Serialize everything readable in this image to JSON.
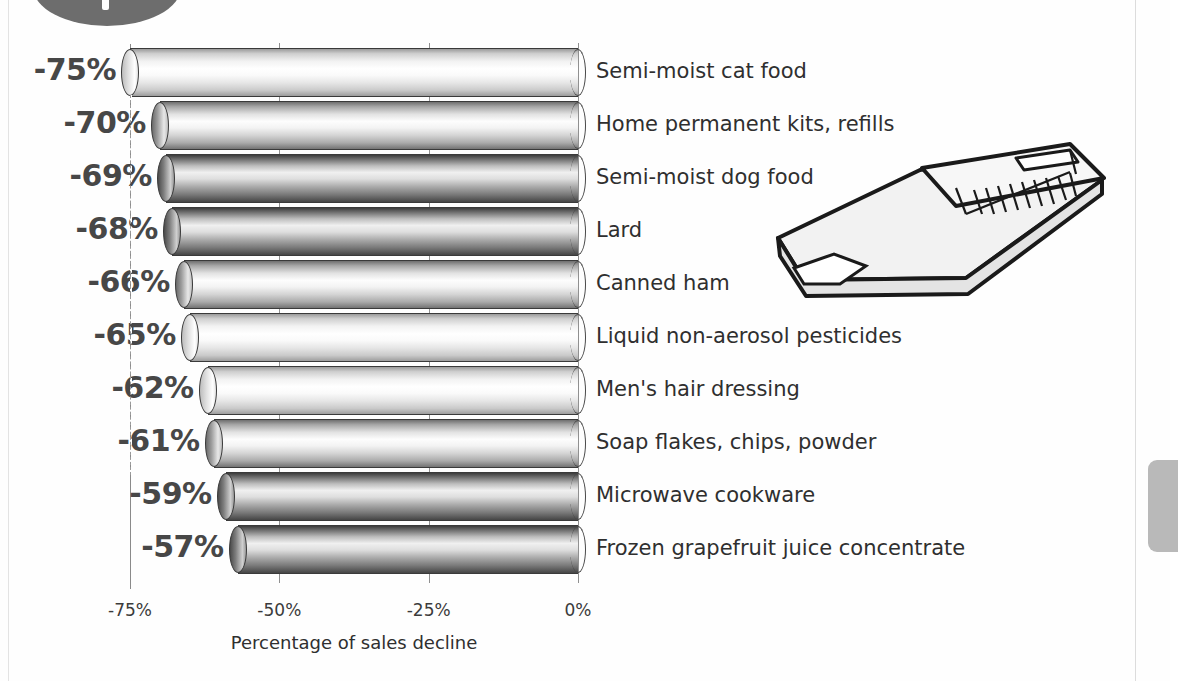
{
  "chart_data": {
    "type": "bar",
    "orientation": "horizontal",
    "title": "",
    "xlabel": "Percentage of sales decline",
    "ylabel": "",
    "xlim": [
      -75,
      0
    ],
    "xticks": [
      "-75%",
      "-50%",
      "-25%",
      "0%"
    ],
    "xtick_values": [
      -75,
      -50,
      -25,
      0
    ],
    "grid": true,
    "legend": null,
    "categories": [
      "Semi-moist cat food",
      "Home permanent kits, refills",
      "Semi-moist dog food",
      "Lard",
      "Canned ham",
      "Liquid non-aerosol pesticides",
      "Men's hair dressing",
      "Soap flakes, chips, powder",
      "Microwave cookware",
      "Frozen grapefruit juice concentrate"
    ],
    "values": [
      -75,
      -70,
      -69,
      -68,
      -66,
      -65,
      -62,
      -61,
      -59,
      -57
    ],
    "data_labels": [
      "-75%",
      "-70%",
      "-69%",
      "-68%",
      "-66%",
      "-65%",
      "-62%",
      "-61%",
      "-59%",
      "-57%"
    ]
  },
  "axis": {
    "x_title": "Percentage of sales decline",
    "ticks": [
      {
        "label": "-75%",
        "value": -75
      },
      {
        "label": "-50%",
        "value": -50
      },
      {
        "label": "-25%",
        "value": -25
      },
      {
        "label": "0%",
        "value": 0
      }
    ]
  },
  "decorations": {
    "page_badge": "page-number-badge",
    "side_tab": "chapter-tab",
    "illustration": "folded-newspaper"
  },
  "colors": {
    "bar_dark": "#3c3c3c",
    "bar_light": "#ffffff",
    "label_text": "#474747",
    "category_text": "#2f2f2f",
    "axis_line": "#8a8a8a",
    "badge": "#6d6d6d",
    "side_tab": "#b9b9b9"
  }
}
